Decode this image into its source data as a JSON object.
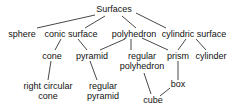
{
  "diagram": {
    "type": "tree",
    "nodes": {
      "surfaces": "Surfaces",
      "sphere": "sphere",
      "conic_surface": "conic surface",
      "polyhedron": "polyhedron",
      "cylindric_surface": "cylindric surface",
      "cone": "cone",
      "pyramid": "pyramid",
      "regular_polyhedron_1": "regular",
      "regular_polyhedron_2": "polyhedron",
      "prism": "prism",
      "cylinder": "cylinder",
      "right_circular_cone_1": "right circular",
      "right_circular_cone_2": "cone",
      "regular_pyramid_1": "regular",
      "regular_pyramid_2": "pyramid",
      "box": "box",
      "cube": "cube"
    },
    "edges": [
      [
        "Surfaces",
        "sphere"
      ],
      [
        "Surfaces",
        "conic surface"
      ],
      [
        "Surfaces",
        "polyhedron"
      ],
      [
        "Surfaces",
        "cylindric surface"
      ],
      [
        "conic surface",
        "cone"
      ],
      [
        "conic surface",
        "pyramid"
      ],
      [
        "polyhedron",
        "pyramid"
      ],
      [
        "polyhedron",
        "regular polyhedron"
      ],
      [
        "polyhedron",
        "prism"
      ],
      [
        "cylindric surface",
        "prism"
      ],
      [
        "cylindric surface",
        "cylinder"
      ],
      [
        "cone",
        "right circular cone"
      ],
      [
        "pyramid",
        "regular pyramid"
      ],
      [
        "regular polyhedron",
        "cube"
      ],
      [
        "prism",
        "box"
      ],
      [
        "box",
        "cube"
      ]
    ]
  }
}
